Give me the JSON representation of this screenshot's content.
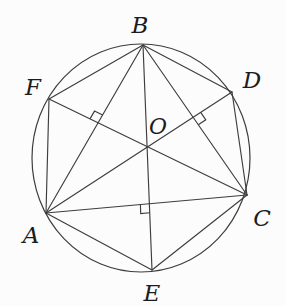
{
  "figure": {
    "background_color": "#fcfcfc",
    "stroke_color": "#3d3d3d",
    "label_color": "#1c1c1c",
    "stroke_width": 1.15,
    "label_font_size": 23,
    "center_label_font_size": 22,
    "circle": {
      "cx": 141,
      "cy": 158,
      "rx": 109,
      "ry": 114
    },
    "points": {
      "A": {
        "x": 46,
        "y": 213,
        "label": "A",
        "label_x": 31,
        "label_y": 243
      },
      "B": {
        "x": 143,
        "y": 45,
        "label": "B",
        "label_x": 140,
        "label_y": 33
      },
      "C": {
        "x": 247,
        "y": 195,
        "label": "C",
        "label_x": 262,
        "label_y": 226
      },
      "D": {
        "x": 232,
        "y": 92,
        "label": "D",
        "label_x": 252,
        "label_y": 88
      },
      "E": {
        "x": 152,
        "y": 270,
        "label": "E",
        "label_x": 152,
        "label_y": 301
      },
      "F": {
        "x": 49,
        "y": 99,
        "label": "F",
        "label_x": 33,
        "label_y": 95
      },
      "O": {
        "x": 143,
        "y": 157,
        "label": "O",
        "label_x": 158,
        "label_y": 134
      }
    },
    "chords": [
      [
        "A",
        "B"
      ],
      [
        "A",
        "C"
      ],
      [
        "A",
        "D"
      ],
      [
        "A",
        "E"
      ],
      [
        "A",
        "F"
      ],
      [
        "B",
        "C"
      ],
      [
        "B",
        "D"
      ],
      [
        "B",
        "E"
      ],
      [
        "B",
        "F"
      ],
      [
        "C",
        "D"
      ],
      [
        "C",
        "E"
      ],
      [
        "C",
        "F"
      ]
    ],
    "right_angle_marks": [
      {
        "name": "FC-perp-AB",
        "line1": [
          "C",
          "F"
        ],
        "ray1": "F",
        "line2": [
          "A",
          "B"
        ],
        "ray2": "B",
        "size": 9
      },
      {
        "name": "AD-perp-BC",
        "line1": [
          "A",
          "D"
        ],
        "ray1": "D",
        "line2": [
          "B",
          "C"
        ],
        "ray2": "C",
        "size": 9
      },
      {
        "name": "BE-perp-AC",
        "line1": [
          "C",
          "A"
        ],
        "ray1": "A",
        "line2": [
          "B",
          "E"
        ],
        "ray2": "E",
        "size": 9
      }
    ]
  }
}
